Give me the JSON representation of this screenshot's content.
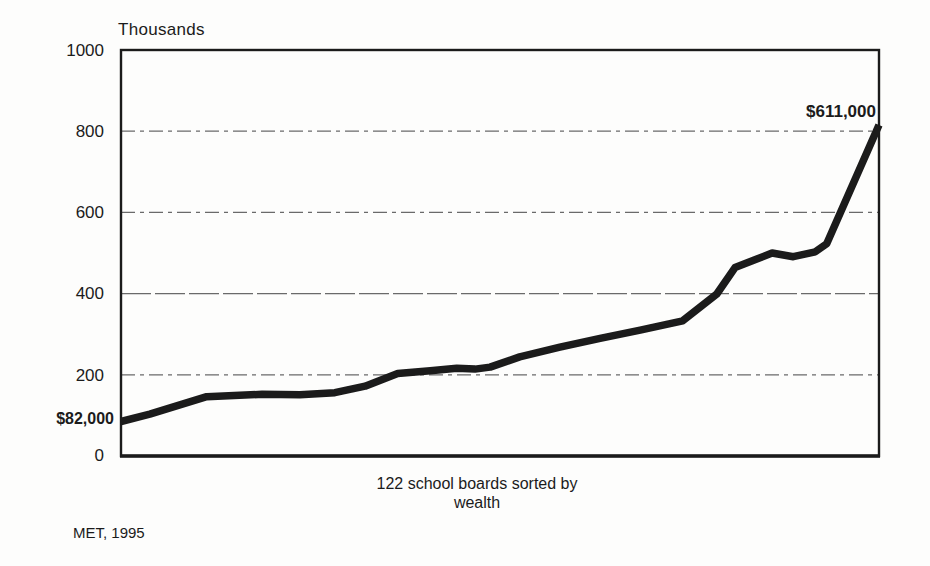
{
  "labels": {
    "title": "Thousands",
    "start_label": "$82,000",
    "end_label": "$611,000",
    "xlabel_line1": "122 school boards sorted by",
    "xlabel_line2": "wealth",
    "source_note": "MET, 1995"
  },
  "axis": {
    "ytick_labels": [
      "1000",
      "800",
      "600",
      "400",
      "200",
      "0"
    ]
  },
  "colors": {
    "line": "#1b1b1b",
    "frame": "#1b1b1b",
    "grid": "#6a6a6a",
    "text": "#1b1b1b",
    "background": "#fdfdfc"
  },
  "chart_data": {
    "type": "line",
    "title": "Thousands",
    "ylabel": "Thousands (of dollars)",
    "xlabel": "122 school boards sorted by wealth",
    "ylim": [
      0,
      1000
    ],
    "yticks": [
      0,
      200,
      400,
      600,
      800,
      1000
    ],
    "grid": "horizontal dash-dot gridlines at 200, 400, 600, 800",
    "legend": "none",
    "n_categories": 122,
    "min_value_dollars": 82000,
    "max_value_dollars": 611000,
    "annotations": [
      {
        "text": "$82,000",
        "position": "start of line"
      },
      {
        "text": "$611,000",
        "position": "end of line"
      }
    ],
    "source": "MET, 1995",
    "series": [
      {
        "name": "School board wealth per pupil (thousands of dollars)",
        "points": [
          {
            "x_frac": 0.0,
            "y": 85
          },
          {
            "x_frac": 0.038,
            "y": 103
          },
          {
            "x_frac": 0.113,
            "y": 146
          },
          {
            "x_frac": 0.186,
            "y": 152
          },
          {
            "x_frac": 0.236,
            "y": 151
          },
          {
            "x_frac": 0.282,
            "y": 156
          },
          {
            "x_frac": 0.322,
            "y": 172
          },
          {
            "x_frac": 0.365,
            "y": 203
          },
          {
            "x_frac": 0.408,
            "y": 210
          },
          {
            "x_frac": 0.443,
            "y": 216
          },
          {
            "x_frac": 0.467,
            "y": 214
          },
          {
            "x_frac": 0.487,
            "y": 219
          },
          {
            "x_frac": 0.526,
            "y": 244
          },
          {
            "x_frac": 0.579,
            "y": 268
          },
          {
            "x_frac": 0.632,
            "y": 290
          },
          {
            "x_frac": 0.685,
            "y": 310
          },
          {
            "x_frac": 0.741,
            "y": 333
          },
          {
            "x_frac": 0.786,
            "y": 399
          },
          {
            "x_frac": 0.81,
            "y": 464
          },
          {
            "x_frac": 0.859,
            "y": 500
          },
          {
            "x_frac": 0.887,
            "y": 491
          },
          {
            "x_frac": 0.916,
            "y": 503
          },
          {
            "x_frac": 0.931,
            "y": 523
          },
          {
            "x_frac": 1.0,
            "y": 815
          }
        ]
      }
    ]
  }
}
